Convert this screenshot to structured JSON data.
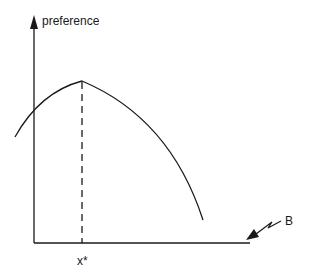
{
  "diagram": {
    "y_axis_label": "preference",
    "x_marker_label": "x*",
    "budget_label": "B",
    "colors": {
      "line": "#1a1a1a",
      "background": "#ffffff"
    },
    "elements": {
      "y_axis": "vertical axis with arrowhead",
      "x_axis": "horizontal axis",
      "curve": "single-peaked preference curve",
      "peak_marker": "dashed vertical line at x*",
      "budget_pointer": "zigzag arrow pointing to axis end"
    }
  }
}
